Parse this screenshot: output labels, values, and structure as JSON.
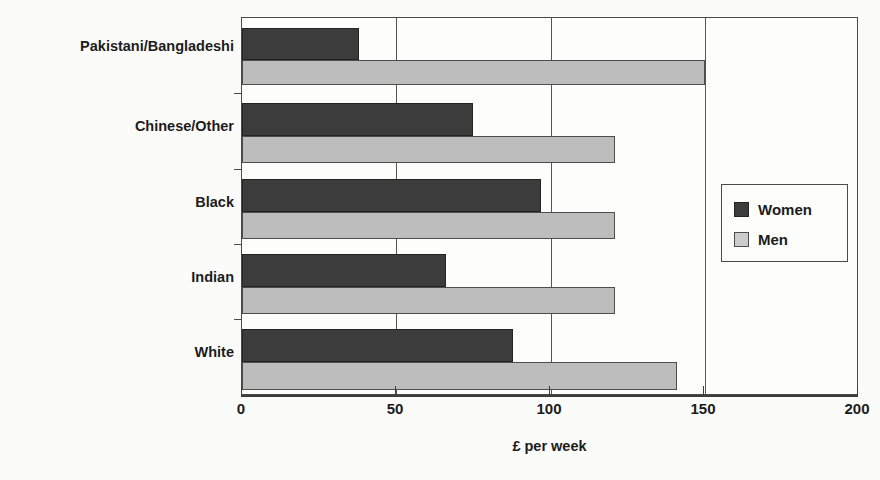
{
  "chart_data": {
    "type": "bar",
    "orientation": "horizontal",
    "title": "",
    "subtitle": "",
    "xlabel": "£ per week",
    "ylabel": "",
    "xlim": [
      0,
      200
    ],
    "xticks": [
      0,
      50,
      100,
      150,
      200
    ],
    "xtick_labels": [
      "0",
      "50",
      "100",
      "150",
      "200"
    ],
    "grid": true,
    "grid_axis": "x",
    "legend_position": "right",
    "categories": [
      "White",
      "Indian",
      "Black",
      "Chinese/Other",
      "Pakistani/Bangladeshi"
    ],
    "categories_top_to_bottom": [
      "Pakistani/Bangladeshi",
      "Chinese/Other",
      "Black",
      "Indian",
      "White"
    ],
    "series": [
      {
        "name": "Women",
        "color": "#3c3c3c",
        "values": [
          88,
          66,
          97,
          75,
          38
        ]
      },
      {
        "name": "Men",
        "color": "#bdbdbd",
        "values": [
          141,
          121,
          121,
          121,
          150
        ]
      }
    ],
    "values_by_category": [
      {
        "category": "Pakistani/Bangladeshi",
        "women": 38,
        "men": 150
      },
      {
        "category": "Chinese/Other",
        "women": 75,
        "men": 121
      },
      {
        "category": "Black",
        "women": 97,
        "men": 121
      },
      {
        "category": "Indian",
        "women": 66,
        "men": 121
      },
      {
        "category": "White",
        "women": 88,
        "men": 141
      }
    ]
  },
  "legend": {
    "items": [
      {
        "label": "Women",
        "swatch": "dark-swatch-icon"
      },
      {
        "label": "Men",
        "swatch": "light-swatch-icon"
      }
    ]
  },
  "axis": {
    "x_title": "£ per week",
    "x_tick_labels": [
      "0",
      "50",
      "100",
      "150",
      "200"
    ]
  },
  "colors": {
    "women": "#3c3c3c",
    "men": "#bdbdbd",
    "frame": "#4a4a4a",
    "background": "#fbfbfa",
    "text": "#1c1c1c"
  }
}
